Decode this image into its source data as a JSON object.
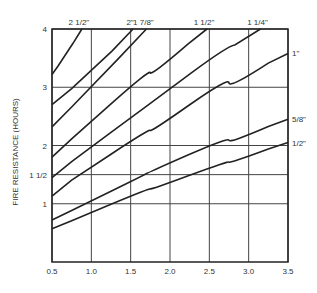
{
  "chart_data": {
    "type": "line",
    "title": "",
    "xlabel": "",
    "ylabel": "FIRE RESISTANCE (HOURS)",
    "xlim": [
      0.5,
      3.5
    ],
    "ylim": [
      0,
      4
    ],
    "grid": true,
    "x_ticks": [
      "0.5",
      "1.0",
      "1.5",
      "2.0",
      "2.5",
      "3.0",
      "3.5"
    ],
    "x_tick_values": [
      0.5,
      1.0,
      1.5,
      2.0,
      2.5,
      3.0,
      3.5
    ],
    "y_ticks": [
      "1",
      "1 1/2",
      "2",
      "3",
      "4"
    ],
    "y_tick_values": [
      1,
      1.5,
      2,
      3,
      4
    ],
    "series": [
      {
        "name": "2 1/2\"",
        "label_pos": "top",
        "points": [
          [
            0.5,
            3.22
          ],
          [
            0.65,
            3.5
          ],
          [
            0.88,
            4.0
          ]
        ]
      },
      {
        "name": "2\"",
        "label_pos": "top",
        "points": [
          [
            0.5,
            2.7
          ],
          [
            1.0,
            3.25
          ],
          [
            1.53,
            4.0
          ]
        ]
      },
      {
        "name": "1 7/8\"",
        "label_pos": "top",
        "points": [
          [
            0.5,
            2.32
          ],
          [
            1.0,
            3.0
          ],
          [
            1.7,
            4.0
          ]
        ]
      },
      {
        "name": "1 1/2\"",
        "label_pos": "top",
        "points": [
          [
            0.5,
            1.8
          ],
          [
            1.0,
            2.43
          ],
          [
            1.5,
            3.0
          ],
          [
            2.0,
            3.5
          ],
          [
            2.47,
            4.0
          ]
        ]
      },
      {
        "name": "1 1/4\"",
        "label_pos": "top",
        "points": [
          [
            0.5,
            1.45
          ],
          [
            1.0,
            2.0
          ],
          [
            1.5,
            2.45
          ],
          [
            2.0,
            3.0
          ],
          [
            2.5,
            3.45
          ],
          [
            3.15,
            4.0
          ]
        ]
      },
      {
        "name": "1\"",
        "label_pos": "right",
        "points": [
          [
            0.5,
            1.13
          ],
          [
            1.0,
            1.68
          ],
          [
            1.5,
            2.02
          ],
          [
            2.0,
            2.5
          ],
          [
            2.5,
            2.9
          ],
          [
            3.0,
            3.25
          ],
          [
            3.5,
            3.58
          ]
        ]
      },
      {
        "name": "5/8\"",
        "label_pos": "right",
        "points": [
          [
            0.5,
            0.72
          ],
          [
            1.0,
            1.05
          ],
          [
            1.5,
            1.38
          ],
          [
            2.0,
            1.72
          ],
          [
            2.5,
            1.98
          ],
          [
            3.0,
            2.2
          ],
          [
            3.5,
            2.45
          ]
        ]
      },
      {
        "name": "1/2\"",
        "label_pos": "right",
        "points": [
          [
            0.5,
            0.57
          ],
          [
            1.0,
            0.85
          ],
          [
            1.5,
            1.13
          ],
          [
            2.0,
            1.38
          ],
          [
            2.5,
            1.6
          ],
          [
            3.0,
            1.83
          ],
          [
            3.5,
            2.05
          ]
        ]
      }
    ]
  }
}
